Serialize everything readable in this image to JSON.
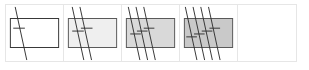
{
  "strip": {
    "cells": [
      {
        "id": "step-1",
        "fill": "#ffffff",
        "lines": 1
      },
      {
        "id": "step-2",
        "fill": "#efefef",
        "lines": 2
      },
      {
        "id": "step-3",
        "fill": "#d9d9d9",
        "lines": 3
      },
      {
        "id": "step-4",
        "fill": "#c9c9c9",
        "lines": 4
      },
      {
        "id": "step-5",
        "fill": "none",
        "lines": 0
      }
    ],
    "stroke": "#333333",
    "border": "#e6e6e6"
  }
}
